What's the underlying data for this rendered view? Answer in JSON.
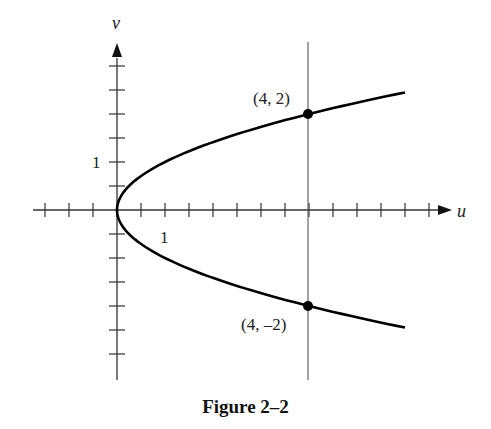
{
  "figure": {
    "caption": "Figure 2–2",
    "axis_labels": {
      "x": "u",
      "y": "v"
    },
    "tick_labels": {
      "x_one": "1",
      "y_one": "1"
    },
    "points": [
      {
        "label": "(4, 2)",
        "u": 4,
        "v": 2
      },
      {
        "label": "(4, –2)",
        "u": 4,
        "v": -2
      }
    ],
    "colors": {
      "curve": "#000000",
      "axis": "#333333",
      "guide": "#555555"
    }
  },
  "chart_data": {
    "type": "line",
    "title": "Figure 2–2",
    "xlabel": "u",
    "ylabel": "v",
    "curve": "u = v^2",
    "series": [
      {
        "name": "u = v^2",
        "points": [
          [
            6.0,
            2.45
          ],
          [
            4.0,
            2.0
          ],
          [
            2.25,
            1.5
          ],
          [
            1.0,
            1.0
          ],
          [
            0.25,
            0.5
          ],
          [
            0.0,
            0.0
          ],
          [
            0.25,
            -0.5
          ],
          [
            1.0,
            -1.0
          ],
          [
            2.25,
            -1.5
          ],
          [
            4.0,
            -2.0
          ],
          [
            6.0,
            -2.45
          ]
        ]
      }
    ],
    "vertical_line": {
      "u": 4
    },
    "marked_points": [
      {
        "u": 4,
        "v": 2,
        "label": "(4, 2)"
      },
      {
        "u": 4,
        "v": -2,
        "label": "(4, –2)"
      }
    ],
    "tick_spacing": 0.5,
    "xlim": [
      -1.75,
      6.5
    ],
    "ylim": [
      -3.0,
      3.0
    ],
    "grid": false
  }
}
